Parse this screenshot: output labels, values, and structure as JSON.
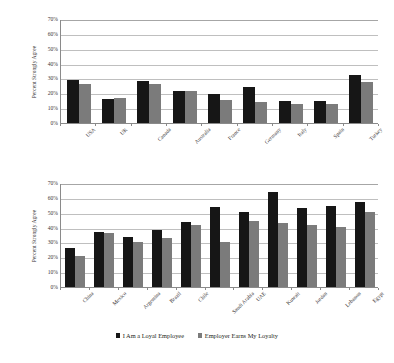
{
  "chart_data": [
    {
      "type": "bar",
      "id": "developed-markets",
      "title": "",
      "xlabel": "",
      "ylabel": "Percent Strongly Agree",
      "ylim": [
        0,
        70
      ],
      "ytick_step": 10,
      "ytick_labels": [
        "0%",
        "10%",
        "20%",
        "30%",
        "40%",
        "50%",
        "60%",
        "70%"
      ],
      "grid": true,
      "legend_position": "bottom",
      "categories": [
        "USA",
        "UK",
        "Canada",
        "Australia",
        "France",
        "Germany",
        "Italy",
        "Spain",
        "Turkey"
      ],
      "series": [
        {
          "name": "I Am a Loyal Employee",
          "color": "#161616",
          "values": [
            29,
            16,
            28.5,
            21.5,
            19.5,
            24,
            15,
            14.5,
            32.5
          ]
        },
        {
          "name": "Employer Earns My Loyalty",
          "color": "#7b7b7b",
          "values": [
            26.5,
            17,
            26.5,
            21.5,
            15.5,
            14,
            13,
            12.5,
            27.5
          ]
        }
      ]
    },
    {
      "type": "bar",
      "id": "emerging-markets",
      "title": "",
      "xlabel": "",
      "ylabel": "Percent Strongly Agree",
      "ylim": [
        0,
        70
      ],
      "ytick_step": 10,
      "ytick_labels": [
        "0%",
        "10%",
        "20%",
        "30%",
        "40%",
        "50%",
        "60%",
        "70%"
      ],
      "grid": true,
      "legend_position": "bottom",
      "categories": [
        "China",
        "Mexico",
        "Argentina",
        "Brazil",
        "Chile",
        "Saudi Arabia",
        "UAE",
        "Kuwait",
        "Jordan",
        "Lebanon",
        "Egypt"
      ],
      "series": [
        {
          "name": "I Am a Loyal Employee",
          "color": "#161616",
          "values": [
            26.5,
            37,
            33.5,
            38.5,
            43.5,
            54,
            50.5,
            64,
            53.5,
            54.5,
            57
          ]
        },
        {
          "name": "Employer Earns My Loyalty",
          "color": "#7b7b7b",
          "values": [
            21,
            36.5,
            30,
            33,
            41.5,
            30.5,
            44.5,
            43,
            42,
            40.5,
            50.5
          ]
        }
      ]
    }
  ],
  "legend": {
    "items": [
      {
        "label": "I Am a Loyal Employee",
        "color": "#161616"
      },
      {
        "label": "Employer Earns My Loyalty",
        "color": "#7b7b7b"
      }
    ]
  }
}
